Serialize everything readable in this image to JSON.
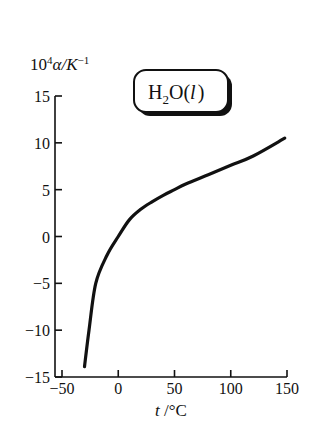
{
  "chart_data": {
    "type": "line",
    "title": "",
    "xlabel": "t /°C",
    "ylabel": "10⁴α/K⁻¹",
    "xlim": [
      -50,
      150
    ],
    "ylim": [
      -15,
      15
    ],
    "x_ticks": [
      -50,
      0,
      50,
      100,
      150
    ],
    "y_ticks": [
      15,
      10,
      5,
      0,
      -5,
      -10,
      -15
    ],
    "grid": false,
    "legend": {
      "label": "H2O(l)",
      "position": "top-center"
    },
    "series": [
      {
        "name": "H2O(l)",
        "x": [
          -30,
          -26,
          -20,
          -10,
          0,
          10,
          20,
          30,
          40,
          50,
          60,
          80,
          100,
          120,
          148
        ],
        "y": [
          -13.9,
          -10.0,
          -5.0,
          -2.0,
          0.0,
          1.8,
          2.9,
          3.7,
          4.4,
          5.0,
          5.6,
          6.6,
          7.6,
          8.6,
          10.5
        ]
      }
    ]
  },
  "labels": {
    "ylabel_base": "10",
    "ylabel_exp": "4",
    "ylabel_rest": "α/K",
    "ylabel_unit_exp": "−1",
    "xlabel_var": "t",
    "xlabel_unit": " /°C",
    "legend_H": "H",
    "legend_sub": "2",
    "legend_O": "O(",
    "legend_l": "l",
    "legend_close": ")"
  }
}
